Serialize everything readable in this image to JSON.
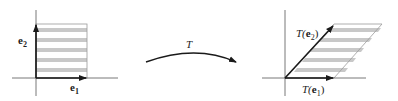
{
  "diagram": {
    "type": "linear-transformation",
    "left_panel": {
      "shape": "unit-square",
      "basis_x_label": "e",
      "basis_x_sub": "1",
      "basis_y_label": "e",
      "basis_y_sub": "2",
      "stripe_count": 5
    },
    "transform": {
      "label": "T"
    },
    "right_panel": {
      "shape": "parallelogram",
      "basis_x_label_prefix": "T(",
      "basis_x_label_vec": "e",
      "basis_x_sub": "1",
      "basis_x_label_suffix": ")",
      "basis_y_label_prefix": "T(",
      "basis_y_label_vec": "e",
      "basis_y_sub": "2",
      "basis_y_label_suffix": ")",
      "stripe_count": 5
    },
    "colors": {
      "axis": "#555555",
      "vector": "#1a1a1a",
      "stripe": "#c8c8c8",
      "outline": "#9a9a9a"
    }
  }
}
